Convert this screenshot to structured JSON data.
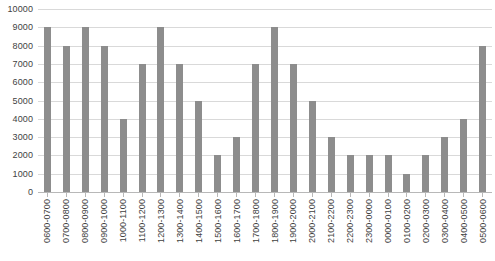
{
  "chart_data": {
    "type": "bar",
    "title": "",
    "subtitle": "",
    "xlabel": "",
    "ylabel": "",
    "ylim": [
      0,
      10000
    ],
    "ytick_step": 1000,
    "yticks": [
      "10000",
      "9000",
      "8000",
      "7000",
      "6000",
      "5000",
      "4000",
      "3000",
      "2000",
      "1000",
      "0"
    ],
    "grid": true,
    "legend": null,
    "legend_position": "none",
    "bar_color": "#8d8d8d",
    "gridline_color": "#d9d9d9",
    "axis_color": "#b8b8b8",
    "text_color": "#3f3f3f",
    "categories": [
      "0600-0700",
      "0700-0800",
      "0800-0900",
      "0900-1000",
      "1000-1100",
      "1100-1200",
      "1200-1300",
      "1300-1400",
      "1400-1500",
      "1500-1600",
      "1600-1700",
      "1700-1800",
      "1800-1900",
      "1900-2000",
      "2000-2100",
      "2100-2200",
      "2200-2300",
      "2300-0000",
      "0000-0100",
      "0100-0200",
      "0200-0300",
      "0300-0400",
      "0400-0500",
      "0500-0600"
    ],
    "values": [
      9000,
      8000,
      9000,
      8000,
      4000,
      7000,
      9000,
      7000,
      5000,
      2000,
      3000,
      7000,
      9000,
      7000,
      5000,
      3000,
      2000,
      2000,
      2000,
      1000,
      2000,
      3000,
      4000,
      8000
    ]
  },
  "cropped_title": ""
}
